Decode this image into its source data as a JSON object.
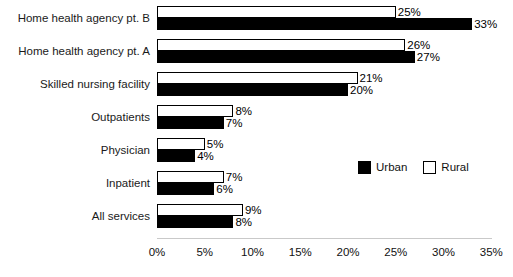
{
  "chart_data": {
    "type": "bar",
    "orientation": "horizontal",
    "title": "",
    "xlabel": "",
    "ylabel": "",
    "categories": [
      "Home health agency pt. B",
      "Home health agency pt. A",
      "Skilled nursing facility",
      "Outpatients",
      "Physician",
      "Inpatient",
      "All services"
    ],
    "series": [
      {
        "name": "Rural",
        "color": "#ffffff",
        "values": [
          25,
          26,
          21,
          8,
          5,
          7,
          9
        ],
        "labels": [
          "25%",
          "26%",
          "21%",
          "8%",
          "5%",
          "7%",
          "9%"
        ]
      },
      {
        "name": "Urban",
        "color": "#000000",
        "values": [
          33,
          27,
          20,
          7,
          4,
          6,
          8
        ],
        "labels": [
          "33%",
          "27%",
          "20%",
          "7%",
          "4%",
          "6%",
          "8%"
        ]
      }
    ],
    "xlim": [
      0,
      35
    ],
    "xticks": [
      0,
      5,
      10,
      15,
      20,
      25,
      30,
      35
    ],
    "xtick_labels": [
      "0%",
      "5%",
      "10%",
      "15%",
      "20%",
      "25%",
      "30%",
      "35%"
    ],
    "grid": false,
    "legend_position": "middle-right"
  },
  "legend": {
    "items": [
      {
        "label": "Urban",
        "swatch": "urban"
      },
      {
        "label": "Rural",
        "swatch": "rural"
      }
    ]
  }
}
